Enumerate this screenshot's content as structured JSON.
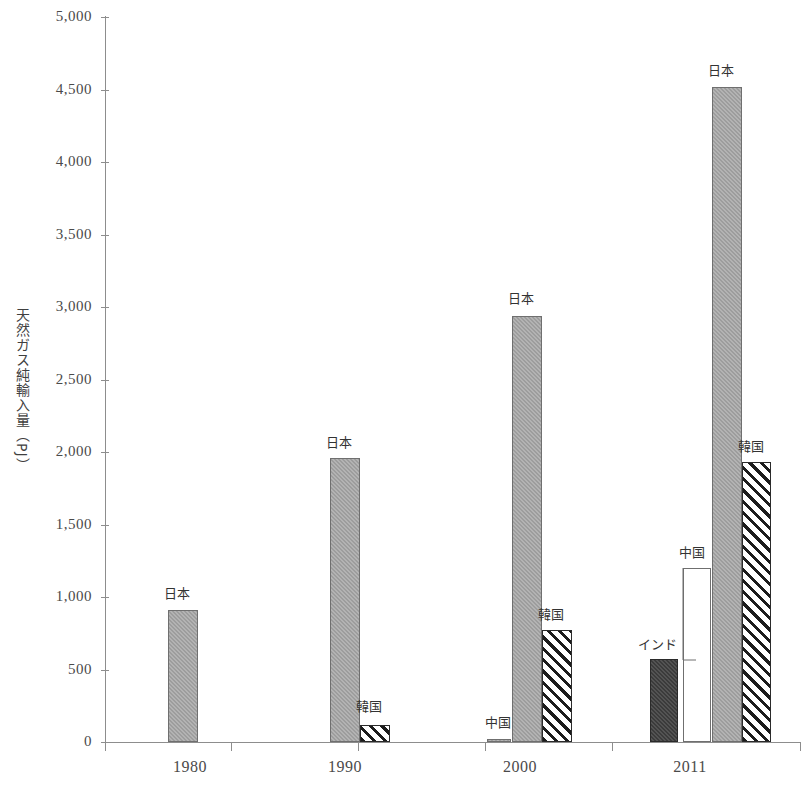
{
  "chart_data": {
    "type": "bar",
    "title": "",
    "xlabel": "",
    "ylabel": "天然ガス純輸入量（PJ）",
    "ylim": [
      0,
      5000
    ],
    "ytick_labels": [
      "5,000",
      "4,500",
      "4,000",
      "3,500",
      "3,000",
      "2,500",
      "2,000",
      "1,500",
      "1,000",
      "500",
      "0"
    ],
    "ytick_values": [
      5000,
      4500,
      4000,
      3500,
      3000,
      2500,
      2000,
      1500,
      1000,
      500,
      0
    ],
    "categories": [
      "1980",
      "1990",
      "2000",
      "2011"
    ],
    "grid": false,
    "legend_position": "none",
    "annotation_style": "per-bar country labels above bars",
    "series": [
      {
        "name": "インド",
        "fill": "dark",
        "values": [
          null,
          null,
          null,
          570
        ]
      },
      {
        "name": "中国",
        "fill": "white",
        "values": [
          null,
          null,
          10,
          1200
        ]
      },
      {
        "name": "日本",
        "fill": "gray",
        "values": [
          910,
          1960,
          2940,
          4520
        ]
      },
      {
        "name": "韓国",
        "fill": "hatch",
        "values": [
          null,
          120,
          770,
          1930
        ]
      }
    ],
    "bars": [
      {
        "group": "1980",
        "series": "日本",
        "label": "日本",
        "value": 910,
        "fill": "gray",
        "x": 168,
        "w": 30,
        "label_x": 160,
        "label_y": 587
      },
      {
        "group": "1990",
        "series": "日本",
        "label": "日本",
        "value": 1960,
        "fill": "gray",
        "x": 330,
        "w": 30,
        "label_x": 322,
        "label_y": 436
      },
      {
        "group": "1990",
        "series": "韓国",
        "label": "韓国",
        "value": 120,
        "fill": "hatch",
        "x": 360,
        "w": 30,
        "label_x": 352,
        "label_y": 700
      },
      {
        "group": "2000",
        "series": "中国",
        "label": "中国",
        "value": 10,
        "fill": "gray",
        "x": 487,
        "w": 24,
        "label_x": 481,
        "label_y": 716
      },
      {
        "group": "2000",
        "series": "日本",
        "label": "日本",
        "value": 2940,
        "fill": "gray",
        "x": 512,
        "w": 30,
        "label_x": 504,
        "label_y": 292
      },
      {
        "group": "2000",
        "series": "韓国",
        "label": "韓国",
        "value": 770,
        "fill": "hatch",
        "x": 542,
        "w": 30,
        "label_x": 534,
        "label_y": 608
      },
      {
        "group": "2011",
        "series": "インド",
        "label": "インド",
        "value": 570,
        "fill": "dark",
        "x": 650,
        "w": 28,
        "label_x": 634,
        "label_y": 638
      },
      {
        "group": "2011",
        "series": "中国",
        "label": "中国",
        "value": 1200,
        "fill": "white",
        "x": 683,
        "w": 28,
        "label_x": 675,
        "label_y": 546
      },
      {
        "group": "2011",
        "series": "日本",
        "label": "日本",
        "value": 4520,
        "fill": "gray",
        "x": 712,
        "w": 30,
        "label_x": 704,
        "label_y": 64
      },
      {
        "group": "2011",
        "series": "韓国",
        "label": "韓国",
        "value": 1930,
        "fill": "hatch",
        "x": 742,
        "w": 29,
        "label_x": 734,
        "label_y": 440
      }
    ]
  },
  "axis": {
    "y_title": "天然ガス純輸入量（PJ）",
    "x_labels": [
      "1980",
      "1990",
      "2000",
      "2011"
    ]
  }
}
